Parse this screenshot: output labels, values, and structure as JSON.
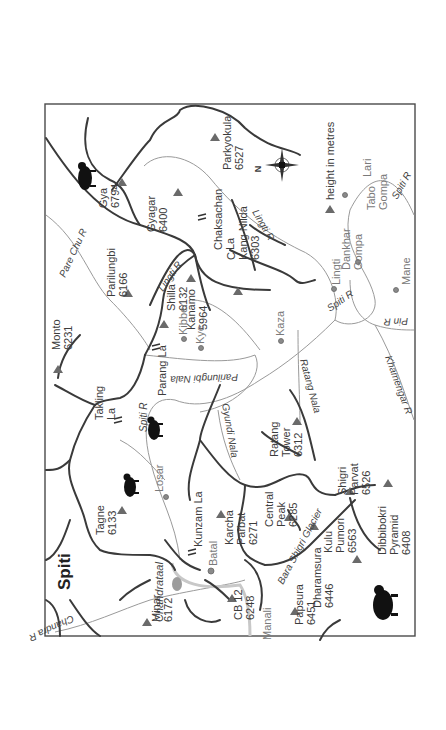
{
  "map": {
    "title": "Spiti",
    "orientation": "rotated-90-ccw",
    "legend": {
      "symbol": "peak-triangle-icon",
      "label": "height in metres"
    },
    "compass": {
      "label": "N"
    },
    "colors": {
      "ridge": "#3a3a3a",
      "river": "#9a9a9a",
      "frame": "#4a4a4a",
      "peak": "#6a6a6a"
    },
    "peaks": [
      {
        "name": "Gya",
        "height": "6794"
      },
      {
        "name": "Gyagar",
        "height": "6400"
      },
      {
        "name": "Parkyokula",
        "height": "6527"
      },
      {
        "name": "Parilungbi",
        "height": "6166"
      },
      {
        "name": "Shilla",
        "height": "6132"
      },
      {
        "name": "Chau Chau Kang Nilda",
        "height": "6303"
      },
      {
        "name": "Kanamo",
        "height": "5964"
      },
      {
        "name": "Monto",
        "height": "6231"
      },
      {
        "name": "Tagne",
        "height": "6133"
      },
      {
        "name": "Karcha Parbat",
        "height": "6271"
      },
      {
        "name": "Ratang Tower",
        "height": "6312"
      },
      {
        "name": "Central Peak",
        "height": "6285"
      },
      {
        "name": "Shigri Parvat",
        "height": "6526"
      },
      {
        "name": "Kulu Pumori",
        "height": "6563"
      },
      {
        "name": "Dharamsura",
        "height": "6446"
      },
      {
        "name": "Papsura",
        "height": "6451"
      },
      {
        "name": "Dibbibokri Pyramid",
        "height": "6408"
      },
      {
        "name": "CB 12",
        "height": "6248"
      },
      {
        "name": "Minar",
        "height": "6172"
      }
    ],
    "passes": [
      "Chaksachan La",
      "Parang La",
      "Takling La",
      "Kunzam La"
    ],
    "rivers": [
      "Pare Chu R",
      "Lingti R",
      "Parilungbi Nala",
      "Spiti R",
      "Gyundi Nala",
      "Ratang Nala",
      "Pin R",
      "Khamengar R",
      "Chandra R"
    ],
    "glacier": "Bara Shigri Glacier",
    "lake": "Chandrataal",
    "places": [
      "Lari",
      "Tabo Gompa",
      "Dankhar Gompa",
      "Lingti",
      "Mane",
      "Kaza",
      "Kibber",
      "Kye",
      "Losar",
      "Batal",
      "Manali"
    ]
  }
}
